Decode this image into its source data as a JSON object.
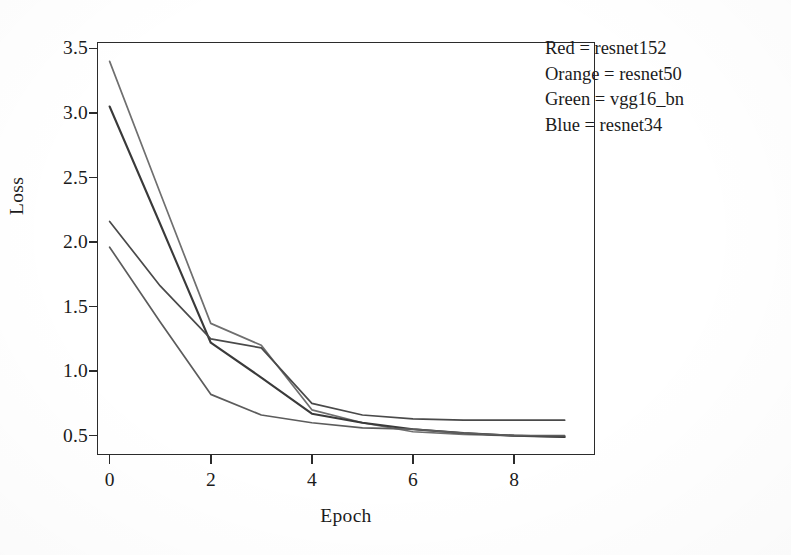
{
  "chart_data": {
    "type": "line",
    "title": "",
    "xlabel": "Epoch",
    "ylabel": "Loss",
    "xlim": [
      -0.25,
      9.6
    ],
    "ylim": [
      0.35,
      3.55
    ],
    "xticks": [
      "0",
      "2",
      "4",
      "6",
      "8"
    ],
    "xtick_values": [
      0,
      2,
      4,
      6,
      8
    ],
    "yticks": [
      "0.5",
      "1.0",
      "1.5",
      "2.0",
      "2.5",
      "3.0",
      "3.5"
    ],
    "ytick_values": [
      0.5,
      1.0,
      1.5,
      2.0,
      2.5,
      3.0,
      3.5
    ],
    "grid": false,
    "legend_position": "upper-right",
    "x": [
      0,
      1,
      2,
      3,
      4,
      5,
      6,
      7,
      8,
      9
    ],
    "series": [
      {
        "name": "vgg16_bn",
        "legend_color_name": "Green",
        "color": "#3f7d3f",
        "values": [
          3.4,
          2.38,
          1.37,
          1.2,
          0.7,
          0.6,
          0.53,
          0.51,
          0.5,
          0.49
        ]
      },
      {
        "name": "resnet152",
        "legend_color_name": "Red",
        "color": "#b03a3a",
        "values": [
          3.05,
          2.14,
          1.22,
          0.95,
          0.67,
          0.6,
          0.55,
          0.52,
          0.5,
          0.49
        ]
      },
      {
        "name": "resnet34",
        "legend_color_name": "Blue",
        "color": "#3a5fa8",
        "values": [
          2.16,
          1.66,
          1.25,
          1.18,
          0.75,
          0.66,
          0.63,
          0.62,
          0.62,
          0.62
        ]
      },
      {
        "name": "resnet50",
        "legend_color_name": "Orange",
        "color": "#d08a2a",
        "values": [
          1.96,
          1.38,
          0.82,
          0.66,
          0.6,
          0.56,
          0.55,
          0.52,
          0.5,
          0.5
        ]
      }
    ]
  },
  "legend": {
    "entries": [
      {
        "text": "Red = resnet152"
      },
      {
        "text": "Orange = resnet50"
      },
      {
        "text": "Green = vgg16_bn"
      },
      {
        "text": "Blue = resnet34"
      }
    ]
  },
  "axes": {
    "y_title": "Loss",
    "x_title": "Epoch"
  },
  "colors": {
    "axis": "#2b2b2b",
    "background": "#ffffff",
    "text": "#1b1b1b"
  }
}
